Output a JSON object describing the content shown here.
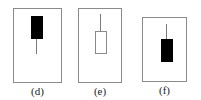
{
  "figure": {
    "background_color": "#ffffff",
    "border_color": "#8a8a8a",
    "filled_color": "#000000",
    "hollow_color": "#ffffff",
    "wick_color": "#7a7a7a"
  },
  "chart_data": {
    "type": "candlestick",
    "title": "",
    "xlabel": "",
    "ylabel": "",
    "grid": false,
    "legend": null,
    "panels": [
      {
        "label": "(d)",
        "body_fill": "filled",
        "shadow": "lower",
        "box": {
          "x": 13,
          "y": 8,
          "width": 49,
          "height": 75
        },
        "body": {
          "x": 30,
          "y": 15,
          "width": 12,
          "height": 23
        },
        "wick": {
          "x": 35,
          "y": 38,
          "length": 15,
          "direction": "down"
        }
      },
      {
        "label": "(e)",
        "body_fill": "hollow",
        "shadow": "upper",
        "box": {
          "x": 78,
          "y": 8,
          "width": 44,
          "height": 75
        },
        "body": {
          "x": 94,
          "y": 30,
          "width": 12,
          "height": 23
        },
        "wick": {
          "x": 99,
          "y": 13,
          "length": 17,
          "direction": "up"
        }
      },
      {
        "label": "(f)",
        "body_fill": "filled",
        "shadow": "upper",
        "box": {
          "x": 142,
          "y": 17,
          "width": 45,
          "height": 65
        },
        "body": {
          "x": 160,
          "y": 38,
          "width": 12,
          "height": 23
        },
        "wick": {
          "x": 165,
          "y": 23,
          "length": 15,
          "direction": "up"
        }
      }
    ]
  }
}
